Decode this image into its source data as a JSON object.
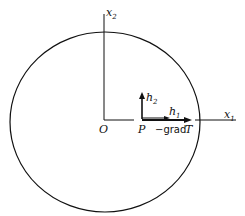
{
  "diagram": {
    "labels": {
      "x1_axis": "x",
      "x1_sub": "1",
      "x2_axis": "x",
      "x2_sub": "2",
      "origin": "O",
      "point_p": "P",
      "h1": "h",
      "h1_sub": "1",
      "h2": "h",
      "h2_sub": "2",
      "grad_label": "−grad",
      "grad_T": "T"
    },
    "colors": {
      "stroke": "#111111",
      "background": "#ffffff"
    }
  }
}
